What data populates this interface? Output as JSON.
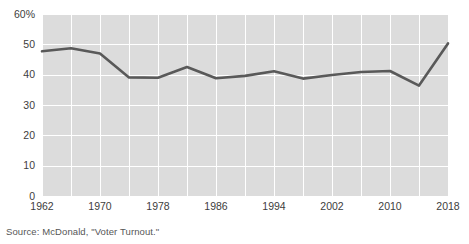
{
  "source_note": "Source: McDonald, \"Voter Turnout.\"",
  "chart_data": {
    "type": "line",
    "title": "",
    "subtitle": "",
    "xlabel": "",
    "ylabel": "",
    "x": [
      1962,
      1966,
      1970,
      1974,
      1978,
      1982,
      1986,
      1990,
      1994,
      1998,
      2002,
      2006,
      2010,
      2014,
      2018
    ],
    "values": [
      47.7,
      48.7,
      47.0,
      39.1,
      39.0,
      42.5,
      38.8,
      39.6,
      41.1,
      38.7,
      39.9,
      40.9,
      41.2,
      36.4,
      50.3
    ],
    "series": [
      {
        "name": "Voter turnout",
        "color": "#595959",
        "values": [
          47.7,
          48.7,
          47.0,
          39.1,
          39.0,
          42.5,
          38.8,
          39.6,
          41.1,
          38.7,
          39.9,
          40.9,
          41.2,
          36.4,
          50.3
        ]
      }
    ],
    "xlim": [
      1962,
      2018
    ],
    "ylim": [
      0,
      60
    ],
    "x_ticks": [
      1962,
      1970,
      1978,
      1986,
      1994,
      2002,
      2010,
      2018
    ],
    "x_tick_labels": [
      "1962",
      "1970",
      "1978",
      "1986",
      "1994",
      "2002",
      "2010",
      "2018"
    ],
    "y_ticks": [
      0,
      10,
      20,
      30,
      40,
      50,
      60
    ],
    "y_tick_labels": [
      "0",
      "10",
      "20",
      "30",
      "40",
      "50",
      "60%"
    ],
    "x_gridlines": [
      1962,
      1966,
      1970,
      1974,
      1978,
      1982,
      1986,
      1990,
      1994,
      1998,
      2002,
      2006,
      2010,
      2014,
      2018
    ],
    "y_gridlines": [
      0,
      10,
      20,
      30,
      40,
      50,
      60
    ],
    "grid": true,
    "legend": false,
    "legend_position": "none",
    "plot_background": "#dcdcdc",
    "gridline_color": "#ffffff",
    "figure_background": "#ffffff"
  }
}
